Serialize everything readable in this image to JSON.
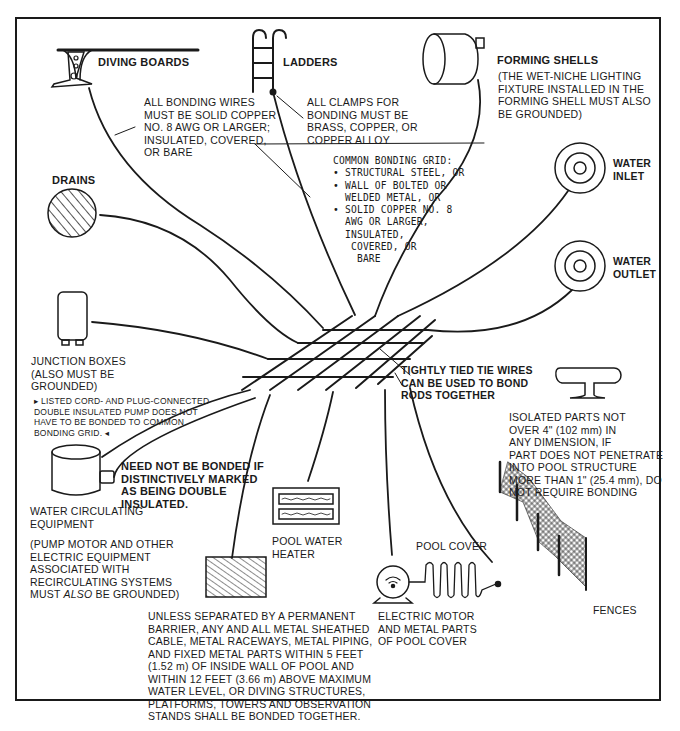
{
  "labels": {
    "diving_boards": "DIVING BOARDS",
    "ladders": "LADDERS",
    "forming_shells": "FORMING SHELLS",
    "forming_shells_note": [
      "(THE WET-NICHE LIGHTING",
      "FIXTURE INSTALLED IN THE",
      "FORMING SHELL MUST ALSO",
      "BE GROUNDED)"
    ],
    "bonding_wires_note": [
      "ALL BONDING WIRES",
      "MUST BE SOLID COPPER",
      "NO. 8 AWG OR LARGER;",
      "INSULATED, COVERED,",
      "OR BARE"
    ],
    "clamps_note": [
      "ALL CLAMPS FOR",
      "BONDING MUST BE",
      "BRASS, COPPER, OR",
      "COPPER ALLOY"
    ],
    "grid_note": {
      "heading": "COMMON BONDING GRID:",
      "items": [
        "• STRUCTURAL STEEL, OR",
        "• WALL OF BOLTED OR",
        "  WELDED METAL, OR",
        "• SOLID COPPER NO. 8",
        "  AWG OR LARGER,",
        "  INSULATED,",
        "   COVERED, OR",
        "    BARE"
      ]
    },
    "drains": "DRAINS",
    "water_inlet": [
      "WATER",
      "INLET"
    ],
    "water_outlet": [
      "WATER",
      "OUTLET"
    ],
    "junction_boxes": [
      "JUNCTION BOXES",
      "(ALSO MUST BE",
      "GROUNDED)"
    ],
    "listed_pump_note": [
      "▸ LISTED CORD- AND PLUG-CONNECTED",
      "DOUBLE INSULATED PUMP DOES NOT",
      "HAVE TO BE BONDED TO COMMON",
      "BONDING GRID. ◂"
    ],
    "tie_wires_note": [
      "TIGHTLY TIED TIE WIRES",
      "CAN BE USED TO BOND",
      "RODS TOGETHER"
    ],
    "isolated_parts_note": [
      "ISOLATED PARTS NOT",
      "OVER 4\" (102 mm) IN",
      "ANY DIMENSION, IF",
      "PART DOES NOT PENETRATE",
      "INTO POOL STRUCTURE",
      "MORE THAN 1\" (25.4 mm), DO",
      "NOT REQUIRE BONDING"
    ],
    "double_insulated_note": [
      "NEED NOT BE BONDED IF",
      "DISTINCTIVELY MARKED",
      "AS BEING DOUBLE",
      "INSULATED."
    ],
    "water_circulating": [
      "WATER CIRCULATING",
      "EQUIPMENT"
    ],
    "pump_motor_note": [
      "(PUMP MOTOR AND OTHER",
      "ELECTRIC EQUIPMENT",
      "ASSOCIATED WITH",
      "RECIRCULATING SYSTEMS"
    ],
    "pump_motor_note_last": {
      "pre": "MUST ",
      "em": "ALSO",
      "post": " BE GROUNDED)"
    },
    "pool_water_heater": [
      "POOL WATER",
      "HEATER"
    ],
    "pool_cover": "POOL COVER",
    "electric_motor": [
      "ELECTRIC MOTOR",
      "AND METAL PARTS",
      "OF POOL COVER"
    ],
    "fences": "FENCES",
    "metal_parts_note": [
      "UNLESS SEPARATED BY A PERMANENT",
      "BARRIER, ANY AND ALL METAL SHEATHED",
      "CABLE, METAL RACEWAYS, METAL PIPING,",
      "AND FIXED METAL PARTS WITHIN 5 FEET",
      "(1.52 m) OF INSIDE WALL OF POOL AND",
      "WITHIN 12 FEET (3.66 m) ABOVE MAXIMUM",
      "WATER LEVEL, OR DIVING STRUCTURES,",
      "PLATFORMS, TOWERS AND OBSERVATION",
      "STANDS SHALL BE BONDED TOGETHER."
    ]
  },
  "colors": {
    "ink": "#1a1a1a",
    "paper": "#ffffff"
  }
}
